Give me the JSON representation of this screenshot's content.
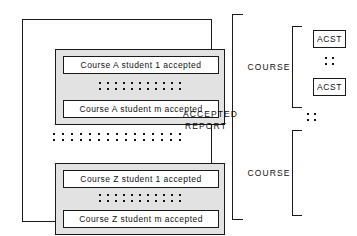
{
  "figure": {
    "colors": {
      "line": "#1a1a1a",
      "group_fill": "#e2e2e2",
      "box_fill": "#ffffff",
      "background": "#ffffff"
    }
  },
  "report": {
    "groups": [
      {
        "id": "course-a",
        "records": [
          {
            "text": "Course A student 1 accepted"
          },
          {
            "text": "Course A student m accepted"
          }
        ],
        "ellipsis_dots_per_row": 11,
        "ellipsis_rows": 2
      },
      {
        "id": "course-z",
        "records": [
          {
            "text": "Course Z student 1 accepted"
          },
          {
            "text": "Course Z student m accepted"
          }
        ],
        "ellipsis_dots_per_row": 11,
        "ellipsis_rows": 2
      }
    ],
    "between_groups_ellipsis": {
      "dots_per_row": 15,
      "rows": 2
    }
  },
  "annotations": {
    "accepted_report_label": "ACCEPTED\nREPORT",
    "accepted_report_line1": "ACCEPTED",
    "accepted_report_line2": "REPORT",
    "course_label_top": "COURSE",
    "course_label_bottom": "COURSE",
    "mid_ellipsis": {
      "rows": 2,
      "dots_per_row": 2
    }
  },
  "acst": {
    "items": [
      {
        "label": "ACST"
      },
      {
        "label": "ACST"
      }
    ],
    "ellipsis": {
      "rows": 2,
      "dots_per_row": 2
    }
  }
}
